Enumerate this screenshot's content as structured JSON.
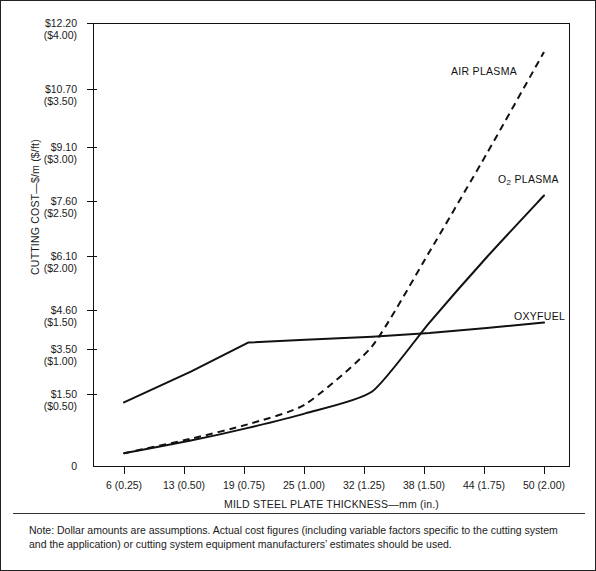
{
  "figure": {
    "note": "Note: Dollar amounts are assumptions. Actual cost figures (including variable factors specific to the cutting system and the application) or cutting system equipment manufacturers’ estimates should be used."
  },
  "chart_data": {
    "type": "line",
    "title": "",
    "xlabel": "MILD STEEL PLATE THICKNESS—mm (in.)",
    "ylabel": "CUTTING COST—$/m ($/ft)",
    "grid": false,
    "legend_position": "inline-annotations",
    "xlim": [
      0,
      54.5
    ],
    "ylim": [
      0,
      12.2
    ],
    "categories": [
      "6 (0.25)",
      "13 (0.50)",
      "19 (0.75)",
      "25 (1.00)",
      "32 (1.25)",
      "38 (1.50)",
      "44 (1.75)",
      "50 (2.00)"
    ],
    "x": [
      6,
      13,
      19,
      25,
      32,
      38,
      44,
      50
    ],
    "xtick_labels": [
      "6 (0.25)",
      "13 (0.50)",
      "19 (0.75)",
      "25 (1.00)",
      "32 (1.25)",
      "38 (1.50)",
      "44 (1.75)",
      "50 (2.00)"
    ],
    "ytick_values": [
      0,
      1.5,
      3.5,
      4.6,
      6.1,
      7.6,
      9.1,
      10.7,
      12.2
    ],
    "ytick_labels": [
      {
        "metric": "0",
        "imperial": ""
      },
      {
        "metric": "$1.50",
        "imperial": "($0.50)"
      },
      {
        "metric": "$3.50",
        "imperial": "($1.00)"
      },
      {
        "metric": "$4.60",
        "imperial": "($1.50)"
      },
      {
        "metric": "$6.10",
        "imperial": "($2.00)"
      },
      {
        "metric": "$7.60",
        "imperial": "($2.50)"
      },
      {
        "metric": "$9.10",
        "imperial": "($3.00)"
      },
      {
        "metric": "$10.70",
        "imperial": "($3.50)"
      },
      {
        "metric": "$12.20",
        "imperial": "($4.00)"
      }
    ],
    "series": [
      {
        "name": "AIR PLASMA",
        "style": "dashed",
        "color": "#111111",
        "label_text": "AIR PLASMA",
        "values": [
          0.35,
          0.75,
          1.15,
          1.7,
          3.3,
          5.9,
          8.6,
          11.4
        ]
      },
      {
        "name": "O2 PLASMA",
        "style": "solid",
        "color": "#111111",
        "label_text": "O₂ PLASMA",
        "label_main": "O",
        "label_sub": "2",
        "label_rest": " PLASMA",
        "values": [
          0.35,
          0.7,
          1.05,
          1.45,
          2.05,
          3.95,
          5.75,
          7.45
        ]
      },
      {
        "name": "OXYFUEL",
        "style": "solid",
        "color": "#111111",
        "label_text": "OXYFUEL",
        "values": [
          1.75,
          2.6,
          3.4,
          3.48,
          3.56,
          3.66,
          3.8,
          3.95
        ]
      }
    ]
  }
}
